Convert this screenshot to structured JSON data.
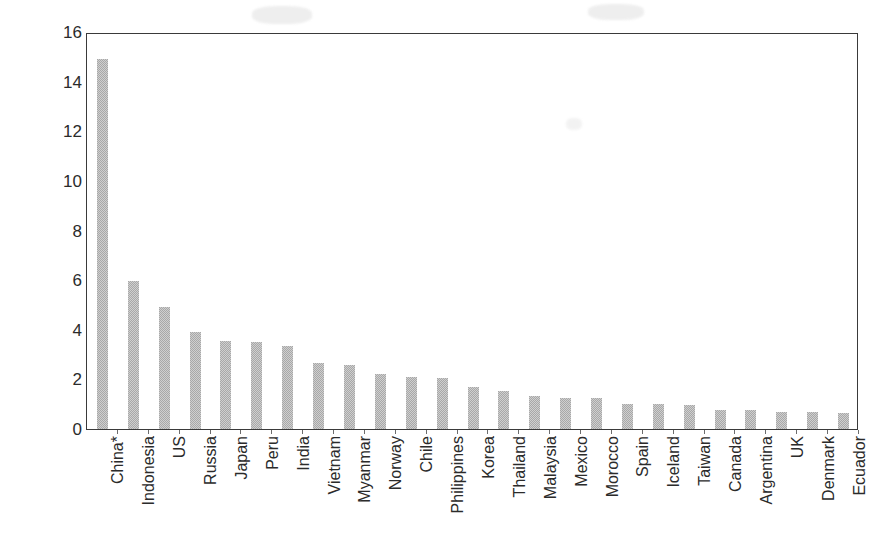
{
  "chart_data": {
    "type": "bar",
    "title": "",
    "subtitle": "",
    "xlabel": "",
    "ylabel": "Marine capture (million tonnes)",
    "ylim": [
      0,
      16
    ],
    "yticks": [
      0,
      2,
      4,
      6,
      8,
      10,
      12,
      14,
      16
    ],
    "ytick_labels": [
      "0",
      "2",
      "4",
      "6",
      "8",
      "10",
      "12",
      "14",
      "16"
    ],
    "grid": false,
    "legend": false,
    "legend_position": "none",
    "bar_color": "#a8a8a8",
    "axis_color": "#3a3a3a",
    "categories": [
      "China*",
      "Indonesia",
      "US",
      "Russia",
      "Japan",
      "Peru",
      "India",
      "Vietnam",
      "Myanmar",
      "Norway",
      "Chile",
      "Philippines",
      "Korea",
      "Thailand",
      "Malaysia",
      "Mexico",
      "Morocco",
      "Spain",
      "Iceland",
      "Taiwan",
      "Canada",
      "Argentina",
      "UK",
      "Denmark",
      "Ecuador"
    ],
    "values": [
      14.9,
      5.95,
      4.9,
      3.9,
      3.55,
      3.5,
      3.35,
      2.65,
      2.6,
      2.2,
      2.1,
      2.05,
      1.7,
      1.55,
      1.35,
      1.25,
      1.25,
      1.0,
      1.0,
      0.95,
      0.75,
      0.75,
      0.7,
      0.7,
      0.65
    ],
    "units": "million tonnes",
    "footnote": "* asterisk on China category label"
  }
}
